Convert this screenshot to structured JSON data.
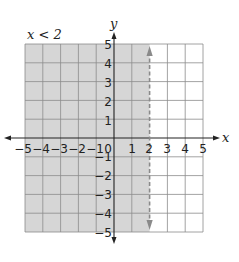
{
  "title": "x < 2",
  "axes": {
    "x_label": "x",
    "y_label": "y",
    "x_ticks": [
      "−5",
      "−4",
      "−3",
      "−2",
      "−1",
      "0",
      "1",
      "2",
      "3",
      "4",
      "5"
    ],
    "y_ticks_pos": [
      "5",
      "4",
      "3",
      "2",
      "1"
    ],
    "y_ticks_neg": [
      "−1",
      "−2",
      "−3",
      "−4",
      "−5"
    ],
    "xlim": [
      -5,
      5
    ],
    "ylim": [
      -5,
      5
    ]
  },
  "boundary": {
    "x": 2,
    "style": "dashed",
    "color": "#8a8a8a"
  },
  "shading": {
    "region": "x < 2",
    "color": "#d6d6d6"
  },
  "grid": {
    "color": "#8c8c8c"
  }
}
